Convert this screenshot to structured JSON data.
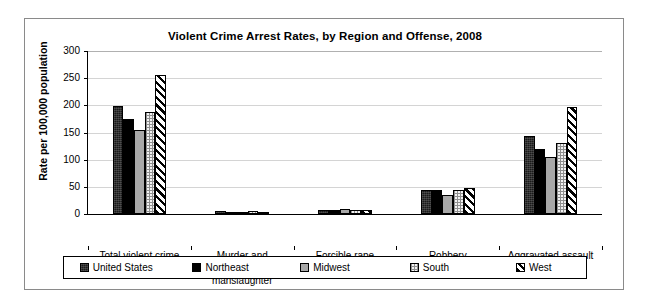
{
  "chart_data": {
    "type": "bar",
    "title": "Violent Crime Arrest Rates, by Region and Offense, 2008",
    "xlabel": "",
    "ylabel": "Rate per 100,000 population",
    "ylim": [
      0,
      300
    ],
    "yticks": [
      0,
      50,
      100,
      150,
      200,
      250,
      300
    ],
    "ytick_labels": [
      "0",
      "50",
      "100",
      "150",
      "200",
      "250",
      "300"
    ],
    "grid": true,
    "legend_position": "bottom",
    "categories": [
      "Total violent crime",
      "Murder and\nnonnegligent\nmanslaughter",
      "Forcible rape",
      "Robbery",
      "Aggravated assault"
    ],
    "series": [
      {
        "name": "United States",
        "pattern": "dark-textured",
        "values": [
          198,
          5,
          8,
          44,
          143
        ]
      },
      {
        "name": "Northeast",
        "pattern": "solid-black",
        "values": [
          175,
          3,
          7,
          45,
          119
        ]
      },
      {
        "name": "Midwest",
        "pattern": "grey",
        "values": [
          154,
          4,
          9,
          35,
          105
        ]
      },
      {
        "name": "South",
        "pattern": "dotted",
        "values": [
          188,
          5,
          7,
          44,
          130
        ]
      },
      {
        "name": "West",
        "pattern": "diagonal-hatch",
        "values": [
          256,
          4,
          7,
          48,
          197
        ]
      }
    ]
  },
  "legend": {
    "items": [
      {
        "label": "United States"
      },
      {
        "label": "Northeast"
      },
      {
        "label": "Midwest"
      },
      {
        "label": "South"
      },
      {
        "label": "West"
      }
    ]
  }
}
